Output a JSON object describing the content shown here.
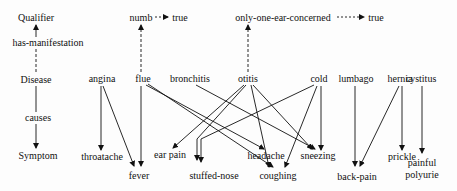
{
  "diagram": {
    "levels": {
      "qualifier": "Qualifier",
      "has_manifestation": "has-manifestation",
      "disease": "Disease",
      "causes": "causes",
      "symptom": "Symptom"
    },
    "qualifiers": [
      {
        "id": "numb",
        "label": "numb",
        "value": "true"
      },
      {
        "id": "only-one-ear-concerned",
        "label": "only-one-ear-concerned",
        "value": "true"
      }
    ],
    "diseases": [
      {
        "id": "angina",
        "label": "angina"
      },
      {
        "id": "flue",
        "label": "flue"
      },
      {
        "id": "bronchitis",
        "label": "bronchitis"
      },
      {
        "id": "otitis",
        "label": "otitis"
      },
      {
        "id": "cold",
        "label": "cold"
      },
      {
        "id": "lumbago",
        "label": "lumbago"
      },
      {
        "id": "hernia",
        "label": "hernia"
      },
      {
        "id": "cystitus",
        "label": "cystitus"
      }
    ],
    "symptoms": [
      {
        "id": "throatache",
        "label": "throatache"
      },
      {
        "id": "fever",
        "label": "fever"
      },
      {
        "id": "ear-pain",
        "label": "ear pain"
      },
      {
        "id": "stuffed-nose",
        "label": "stuffed-nose"
      },
      {
        "id": "headache",
        "label": "headache"
      },
      {
        "id": "coughing",
        "label": "coughing"
      },
      {
        "id": "sneezing",
        "label": "sneezing"
      },
      {
        "id": "back-pain",
        "label": "back-pain"
      },
      {
        "id": "prickle",
        "label": "prickle"
      },
      {
        "id": "painful-polyurie",
        "label": "painful polyurie"
      }
    ],
    "manifestation_edges": [
      {
        "from": "flue",
        "to": "numb",
        "style": "dashed"
      },
      {
        "from": "otitis",
        "to": "only-one-ear-concerned",
        "style": "dashed"
      }
    ],
    "value_edges": [
      {
        "from": "numb",
        "to": "true",
        "style": "dashed"
      },
      {
        "from": "only-one-ear-concerned",
        "to": "true",
        "style": "dashed"
      }
    ],
    "causes_edges": [
      {
        "from": "angina",
        "to": "throatache"
      },
      {
        "from": "angina",
        "to": "fever"
      },
      {
        "from": "flue",
        "to": "fever"
      },
      {
        "from": "flue",
        "to": "headache"
      },
      {
        "from": "flue",
        "to": "coughing"
      },
      {
        "from": "bronchitis",
        "to": "sneezing"
      },
      {
        "from": "otitis",
        "to": "ear pain"
      },
      {
        "from": "otitis",
        "to": "stuffed-nose"
      },
      {
        "from": "otitis",
        "to": "coughing"
      },
      {
        "from": "otitis",
        "to": "sneezing"
      },
      {
        "from": "cold",
        "to": "stuffed-nose"
      },
      {
        "from": "cold",
        "to": "coughing"
      },
      {
        "from": "cold",
        "to": "sneezing"
      },
      {
        "from": "lumbago",
        "to": "back-pain"
      },
      {
        "from": "hernia",
        "to": "back-pain"
      },
      {
        "from": "hernia",
        "to": "prickle"
      },
      {
        "from": "cystitus",
        "to": "painful polyurie"
      }
    ]
  }
}
